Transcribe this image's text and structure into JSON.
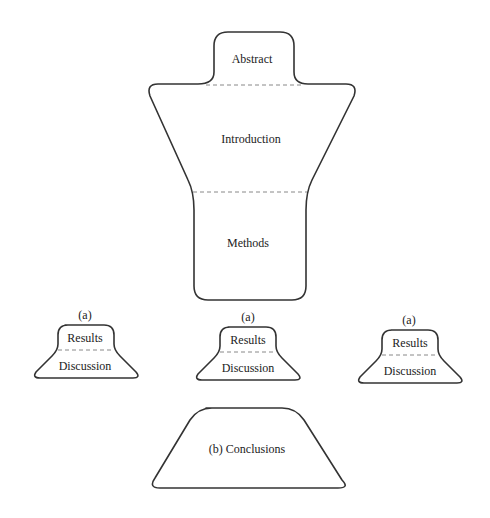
{
  "diagram": {
    "type": "paper-structure-shapes",
    "main_shape": {
      "sections": [
        {
          "label": "Abstract"
        },
        {
          "label": "Introduction"
        },
        {
          "label": "Methods"
        }
      ]
    },
    "result_blocks": [
      {
        "tag": "(a)",
        "top_label": "Results",
        "bottom_label": "Discussion"
      },
      {
        "tag": "(a)",
        "top_label": "Results",
        "bottom_label": "Discussion"
      },
      {
        "tag": "(a)",
        "top_label": "Results",
        "bottom_label": "Discussion"
      }
    ],
    "conclusion": {
      "label": "(b) Conclusions"
    },
    "colors": {
      "stroke": "#333333",
      "dash": "#888888",
      "background": "#ffffff"
    }
  }
}
